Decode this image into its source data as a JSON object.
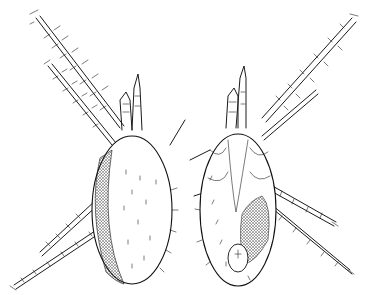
{
  "image": {
    "subject": "mite illustration",
    "views": [
      {
        "name": "dorsal view",
        "position": "left"
      },
      {
        "name": "ventral view",
        "position": "right"
      }
    ],
    "style": "black ink line drawing on white",
    "colors": {
      "background": "#ffffff",
      "ink": "#111111"
    }
  }
}
